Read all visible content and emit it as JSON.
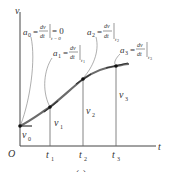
{
  "diagram": {
    "axes": {
      "y_label": "v",
      "x_label": "t",
      "origin_label": "O"
    },
    "ticks": [
      {
        "label": "t",
        "sub": "1"
      },
      {
        "label": "t",
        "sub": "2"
      },
      {
        "label": "t",
        "sub": "3"
      }
    ],
    "velocities": [
      {
        "label": "v",
        "sub": "0"
      },
      {
        "label": "v",
        "sub": "1"
      },
      {
        "label": "v",
        "sub": "2"
      },
      {
        "label": "v",
        "sub": "3"
      }
    ],
    "annotations": [
      {
        "lhs": "a",
        "sub": "0",
        "eq": "= dv/dt |",
        "eval": "t = 0",
        "rhs": "= 0"
      },
      {
        "lhs": "a",
        "sub": "1",
        "eq": "= dv/dt |",
        "eval": "t1"
      },
      {
        "lhs": "a",
        "sub": "2",
        "eq": "= dv/dt |",
        "eval": "t2"
      },
      {
        "lhs": "a",
        "sub": "3",
        "eq": "= dv/dt |",
        "eval": "t3"
      }
    ],
    "caption": "(a)",
    "colors": {
      "curve": "#6b6b6b",
      "axis": "#444444",
      "text": "#333333"
    }
  }
}
